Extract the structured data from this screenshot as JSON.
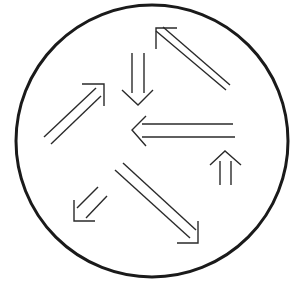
{
  "diagram": {
    "colors": {
      "background": "#ffffff",
      "stroke": "#2a2a2a",
      "circle": "#1a1a1a"
    },
    "circle": {
      "cx": 152,
      "cy": 141,
      "r": 136
    },
    "arrows": [
      {
        "id": "arrow-up-left",
        "direction": "up-left",
        "shaft1": [
          156,
          31,
          226,
          90
        ],
        "shaft2": [
          163,
          27,
          230,
          85
        ],
        "head": "156,49 156,28 177,28"
      },
      {
        "id": "arrow-down",
        "direction": "down",
        "shaft1": [
          132,
          53,
          132,
          93
        ],
        "shaft2": [
          144,
          53,
          144,
          93
        ],
        "head": "122,90 138,105 153,90"
      },
      {
        "id": "arrow-up-right",
        "direction": "up-right",
        "shaft1": [
          44,
          137,
          96,
          88
        ],
        "shaft2": [
          51,
          144,
          101,
          96
        ],
        "head": "82,84 104,84 104,106"
      },
      {
        "id": "arrow-left",
        "direction": "left",
        "shaft1": [
          142,
          124,
          233,
          124
        ],
        "shaft2": [
          142,
          137,
          235,
          137
        ],
        "head": "146,116 132,130 146,146"
      },
      {
        "id": "arrow-up-small",
        "direction": "up",
        "shaft1": [
          220,
          161,
          220,
          185
        ],
        "shaft2": [
          231,
          161,
          231,
          185
        ],
        "head": "210,165 225,151 241,165"
      },
      {
        "id": "arrow-down-right",
        "direction": "down-right",
        "shaft1": [
          115,
          170,
          190,
          238
        ],
        "shaft2": [
          123,
          163,
          196,
          230
        ],
        "head": "177,243 198,243 198,221"
      },
      {
        "id": "arrow-down-left",
        "direction": "down-left",
        "shaft1": [
          98,
          187,
          77,
          208
        ],
        "shaft2": [
          107,
          196,
          86,
          218
        ],
        "head": "74,200 74,221 95,221"
      }
    ]
  }
}
